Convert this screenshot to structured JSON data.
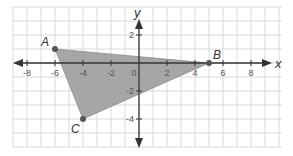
{
  "chart_data": {
    "type": "scatter",
    "title": "",
    "xlabel": "x",
    "ylabel": "y",
    "xlim": [
      -9,
      10
    ],
    "ylim": [
      -6,
      4
    ],
    "grid": true,
    "x_ticks": [
      -8,
      -6,
      -4,
      -2,
      0,
      2,
      4,
      6,
      8
    ],
    "y_ticks": [
      2,
      -2,
      -4
    ],
    "x_tick_labels": [
      "-8",
      "-6",
      "-4",
      "-2",
      "0",
      "2",
      "4",
      "6",
      "8"
    ],
    "y_tick_labels": [
      "2",
      "-2",
      "-4"
    ],
    "points": [
      {
        "label": "A",
        "x": -6,
        "y": 1
      },
      {
        "label": "B",
        "x": 5,
        "y": 0
      },
      {
        "label": "C",
        "x": -4,
        "y": -4
      }
    ],
    "shape": {
      "type": "triangle",
      "vertices": [
        "A",
        "B",
        "C"
      ],
      "fill": "#a6a6a6"
    }
  },
  "axes": {
    "x_name": "x",
    "y_name": "y",
    "origin_label": "0"
  },
  "colors": {
    "grid": "#d9d9d9",
    "axis": "#333333",
    "fill": "#a6a6a6",
    "point": "#555555"
  }
}
